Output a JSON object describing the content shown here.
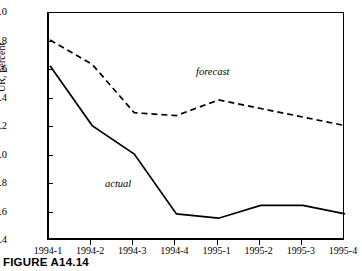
{
  "caption": "FIGURE A14.14",
  "axes": {
    "ylabel": "UR, percent",
    "y_ticks": [
      "7.0",
      "6.8",
      "6.6",
      "6.4",
      "6.2",
      "6.0",
      "5.8",
      "5.6",
      "5.4"
    ],
    "x_ticks": [
      "1994-1",
      "1994-2",
      "1994-3",
      "1994-4",
      "1995-1",
      "1995-2",
      "1995-3",
      "1995-4"
    ]
  },
  "labels": {
    "forecast": "forecast",
    "actual": "actual"
  },
  "colors": {
    "line": "#000000",
    "background": "#ffffff"
  },
  "chart_data": {
    "type": "line",
    "title": "",
    "xlabel": "",
    "ylabel": "UR, percent",
    "ylim": [
      5.4,
      7.0
    ],
    "ytick_step": 0.2,
    "grid": false,
    "legend": "inline-annotations",
    "categories": [
      "1994-1",
      "1994-2",
      "1994-3",
      "1994-4",
      "1995-1",
      "1995-2",
      "1995-3",
      "1995-4"
    ],
    "series": [
      {
        "name": "forecast",
        "style": "dashed",
        "values": [
          6.81,
          6.64,
          6.3,
          6.28,
          6.39,
          6.33,
          6.27,
          6.21
        ]
      },
      {
        "name": "actual",
        "style": "solid",
        "values": [
          6.63,
          6.21,
          6.01,
          5.59,
          5.56,
          5.65,
          5.65,
          5.59
        ]
      }
    ]
  }
}
